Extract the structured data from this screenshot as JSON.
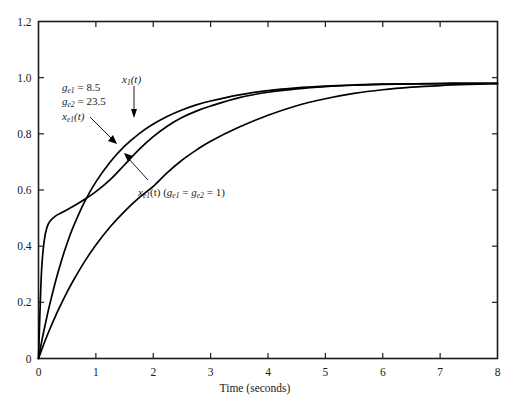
{
  "chart_data": {
    "type": "line",
    "title": "",
    "xlabel": "Time (seconds)",
    "ylabel": "",
    "xlim": [
      0,
      8
    ],
    "ylim": [
      0,
      1.2
    ],
    "grid": false,
    "legend_position": "in-plot annotations",
    "x_ticks": [
      "0",
      "1",
      "2",
      "3",
      "4",
      "5",
      "6",
      "7",
      "8"
    ],
    "x_tick_values": [
      0,
      1,
      2,
      3,
      4,
      5,
      6,
      7,
      8
    ],
    "y_ticks": [
      "0",
      "0.2",
      "0.4",
      "0.6",
      "0.8",
      "1.0",
      "1.2"
    ],
    "y_tick_values": [
      0,
      0.2,
      0.4,
      0.6,
      0.8,
      1.0,
      1.2
    ],
    "x": [
      0,
      0.05,
      0.1,
      0.15,
      0.2,
      0.3,
      0.4,
      0.5,
      0.6,
      0.8,
      1.0,
      1.25,
      1.5,
      1.75,
      2.0,
      2.25,
      2.5,
      2.75,
      3.0,
      3.5,
      4.0,
      4.5,
      5.0,
      5.5,
      6.0,
      6.5,
      7.0,
      7.5,
      8.0
    ],
    "series": [
      {
        "name": "x1(t)",
        "label": "x_1(t)",
        "values": [
          0,
          0.055,
          0.105,
          0.152,
          0.196,
          0.277,
          0.348,
          0.411,
          0.466,
          0.557,
          0.629,
          0.7,
          0.756,
          0.8,
          0.835,
          0.863,
          0.885,
          0.903,
          0.917,
          0.939,
          0.954,
          0.964,
          0.97,
          0.974,
          0.977,
          0.978,
          0.979,
          0.98,
          0.98
        ]
      },
      {
        "name": "xe1(t) high gain",
        "label": "x_e1(t)",
        "note": "g_e1 = 8.5, g_e2 = 23.5",
        "values": [
          0,
          0.3,
          0.42,
          0.468,
          0.489,
          0.508,
          0.519,
          0.53,
          0.541,
          0.566,
          0.594,
          0.637,
          0.69,
          0.744,
          0.79,
          0.828,
          0.858,
          0.881,
          0.899,
          0.929,
          0.948,
          0.96,
          0.968,
          0.973,
          0.976,
          0.978,
          0.979,
          0.98,
          0.98
        ]
      },
      {
        "name": "xe1(t) unity gain",
        "label": "x_e1(t)",
        "note": "g_e1 = g_e2 = 1",
        "values": [
          0,
          0.028,
          0.055,
          0.081,
          0.106,
          0.153,
          0.196,
          0.237,
          0.275,
          0.344,
          0.404,
          0.469,
          0.524,
          0.572,
          0.613,
          0.663,
          0.706,
          0.742,
          0.774,
          0.824,
          0.866,
          0.9,
          0.925,
          0.944,
          0.957,
          0.966,
          0.972,
          0.976,
          0.979
        ]
      }
    ],
    "annotations": [
      {
        "id": "gain-line-1",
        "text_parts": {
          "var": "g",
          "sub": "e1",
          "rest": " = 8.5"
        },
        "full": "g_e1 = 8.5"
      },
      {
        "id": "gain-line-2",
        "text_parts": {
          "var": "g",
          "sub": "e2",
          "rest": " = 23.5"
        },
        "full": "g_e2 = 23.5"
      },
      {
        "id": "xe1-label",
        "full": "x_e1(t)"
      },
      {
        "id": "x1-label",
        "full": "x_1(t)"
      },
      {
        "id": "xe1-unity-label",
        "full": "x_e1(t)   (g_e1 = g_e2 = 1)"
      }
    ]
  },
  "labels": {
    "x_axis_title": "Time (seconds)",
    "x_ticks": [
      "0",
      "1",
      "2",
      "3",
      "4",
      "5",
      "6",
      "7",
      "8"
    ],
    "y_ticks": [
      "1.2",
      "1.0",
      "0.8",
      "0.6",
      "0.4",
      "0.2",
      "0"
    ],
    "annot_gain1_var": "g",
    "annot_gain1_sub": "e1",
    "annot_gain1_rest": " = 8.5",
    "annot_gain2_var": "g",
    "annot_gain2_sub": "e2",
    "annot_gain2_rest": " = 23.5",
    "annot_xe1_var": "x",
    "annot_xe1_sub": "e1",
    "annot_xe1_rest": "(t)",
    "annot_x1_var": "x",
    "annot_x1_sub": "1",
    "annot_x1_rest": "(t)",
    "annot_unity_var": "x",
    "annot_unity_sub": "e1",
    "annot_unity_mid": "(t)   (",
    "annot_unity_g1": "g",
    "annot_unity_g1sub": "e1",
    "annot_unity_eq": " = ",
    "annot_unity_g2": "g",
    "annot_unity_g2sub": "e2",
    "annot_unity_end": " = 1)"
  },
  "colors": {
    "curve": "#000000",
    "frame": "#1c1c1c",
    "background": "#ffffff",
    "text": "#1a1a1a"
  }
}
